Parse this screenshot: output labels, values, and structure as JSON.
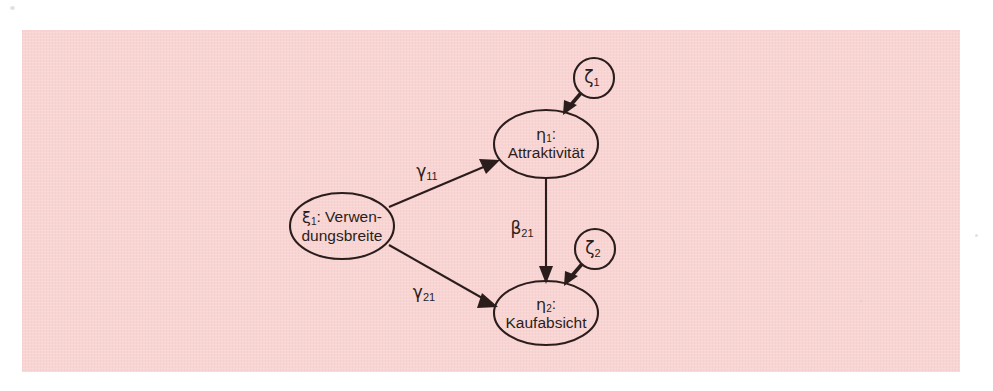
{
  "figure": {
    "type": "path-diagram",
    "background_color": "#f8d5d3",
    "line_color": "#2b1d1c"
  },
  "nodes": {
    "xi1": {
      "id": "xi1",
      "kind": "ellipse",
      "greek": "ξ",
      "subscript": "1",
      "label_line1": ": Verwen-",
      "label_line2": "dungsbreite",
      "full_label": "ξ₁: Verwendungsbreite",
      "cx": 342,
      "cy": 226,
      "rx": 52,
      "ry": 33
    },
    "eta1": {
      "id": "eta1",
      "kind": "ellipse",
      "greek": "η",
      "subscript": "1",
      "label_line1": ":",
      "label_line2": "Attraktivität",
      "full_label": "η₁: Attraktivität",
      "cx": 546,
      "cy": 144,
      "rx": 52,
      "ry": 34
    },
    "eta2": {
      "id": "eta2",
      "kind": "ellipse",
      "greek": "η",
      "subscript": "2",
      "label_line1": ":",
      "label_line2": "Kaufabsicht",
      "full_label": "η₂: Kaufabsicht",
      "cx": 546,
      "cy": 313,
      "rx": 52,
      "ry": 32
    },
    "zeta1": {
      "id": "zeta1",
      "kind": "circle",
      "greek": "ζ",
      "subscript": "1",
      "full_label": "ζ₁",
      "cx": 594,
      "cy": 78,
      "r": 20
    },
    "zeta2": {
      "id": "zeta2",
      "kind": "circle",
      "greek": "ζ",
      "subscript": "2",
      "full_label": "ζ₂",
      "cx": 595,
      "cy": 249,
      "r": 20
    }
  },
  "edges": {
    "gamma11": {
      "id": "gamma11",
      "from": "xi1",
      "to": "eta1",
      "greek": "γ",
      "subscript": "11",
      "full_label": "γ₁₁",
      "label_x": 427,
      "label_y": 172
    },
    "gamma21": {
      "id": "gamma21",
      "from": "xi1",
      "to": "eta2",
      "greek": "γ",
      "subscript": "21",
      "full_label": "γ₂₁",
      "label_x": 424,
      "label_y": 293
    },
    "beta21": {
      "id": "beta21",
      "from": "eta1",
      "to": "eta2",
      "greek": "β",
      "subscript": "21",
      "full_label": "β₂₁",
      "label_x": 522,
      "label_y": 229
    },
    "zeta1_to_eta1": {
      "id": "zeta1-to-eta1",
      "from": "zeta1",
      "to": "eta1",
      "full_label": ""
    },
    "zeta2_to_eta2": {
      "id": "zeta2-to-eta2",
      "from": "zeta2",
      "to": "eta2",
      "full_label": ""
    }
  }
}
